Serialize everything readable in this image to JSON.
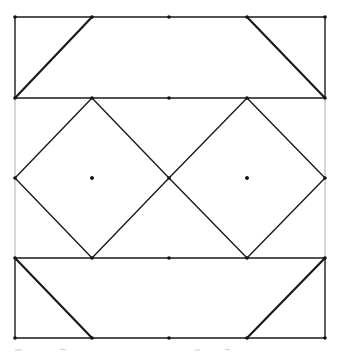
{
  "diagram": {
    "colors": {
      "stroke": "#1a1a1a",
      "background": "#ffffff",
      "faint_side": "#9a9a9a"
    },
    "grid": {
      "x": [
        15,
        92,
        169,
        247,
        325
      ],
      "y": [
        17,
        98,
        178,
        258,
        338
      ]
    },
    "top_band": {
      "rect": [
        [
          15,
          17
        ],
        [
          325,
          17
        ],
        [
          325,
          98
        ],
        [
          15,
          98
        ]
      ],
      "diagonals": [
        [
          [
            92,
            17
          ],
          [
            15,
            98
          ]
        ],
        [
          [
            247,
            17
          ],
          [
            325,
            98
          ]
        ]
      ]
    },
    "middle_band": {
      "diamonds": [
        {
          "points": [
            [
              92,
              98
            ],
            [
              169,
              178
            ],
            [
              92,
              258
            ],
            [
              15,
              178
            ]
          ],
          "center": [
            92,
            178
          ]
        },
        {
          "points": [
            [
              247,
              98
            ],
            [
              325,
              178
            ],
            [
              247,
              258
            ],
            [
              169,
              178
            ]
          ],
          "center": [
            247,
            178
          ]
        }
      ]
    },
    "bottom_band": {
      "rect": [
        [
          15,
          258
        ],
        [
          325,
          258
        ],
        [
          325,
          338
        ],
        [
          15,
          338
        ]
      ],
      "diagonals": [
        [
          [
            15,
            258
          ],
          [
            92,
            338
          ]
        ],
        [
          [
            325,
            258
          ],
          [
            247,
            338
          ]
        ]
      ]
    },
    "dots": [
      [
        15,
        17
      ],
      [
        92,
        17
      ],
      [
        169,
        17
      ],
      [
        247,
        17
      ],
      [
        325,
        17
      ],
      [
        15,
        98
      ],
      [
        92,
        98
      ],
      [
        169,
        98
      ],
      [
        247,
        98
      ],
      [
        325,
        98
      ],
      [
        15,
        178
      ],
      [
        92,
        178
      ],
      [
        169,
        178
      ],
      [
        247,
        178
      ],
      [
        325,
        178
      ],
      [
        15,
        258
      ],
      [
        92,
        258
      ],
      [
        169,
        258
      ],
      [
        247,
        258
      ],
      [
        325,
        258
      ],
      [
        15,
        338
      ],
      [
        92,
        338
      ],
      [
        169,
        338
      ],
      [
        247,
        338
      ],
      [
        325,
        338
      ]
    ]
  }
}
